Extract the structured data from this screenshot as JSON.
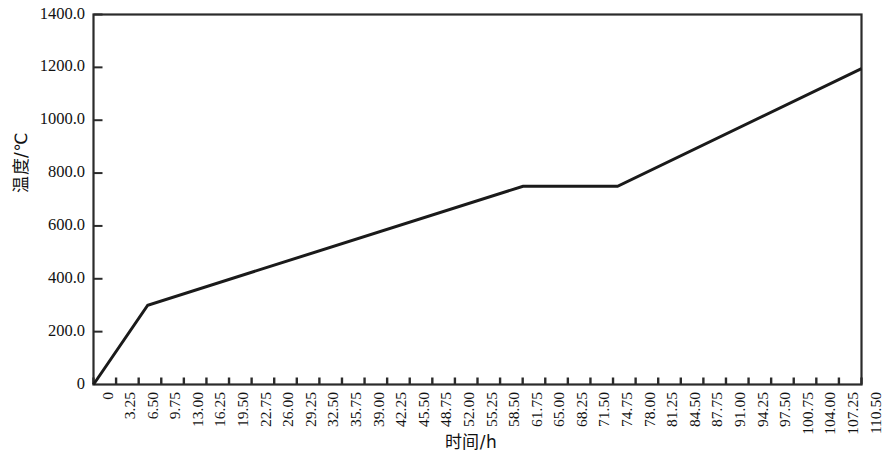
{
  "chart_data": {
    "type": "line",
    "title": "",
    "xlabel": "时间/h",
    "ylabel": "温度/℃",
    "xlim": [
      0,
      110.5
    ],
    "ylim": [
      0,
      1400
    ],
    "grid": false,
    "legend": null,
    "y_ticks": [
      0,
      200,
      400,
      600,
      800,
      1000,
      1200,
      1400
    ],
    "y_tick_labels": [
      "0",
      "200.0",
      "400.0",
      "600.0",
      "800.0",
      "1000.0",
      "1200.0",
      "1400.0"
    ],
    "x_ticks": [
      0,
      3.25,
      6.5,
      9.75,
      13.0,
      16.25,
      19.5,
      22.75,
      26.0,
      29.25,
      32.5,
      35.75,
      39.0,
      42.25,
      45.5,
      48.75,
      52.0,
      55.25,
      58.5,
      61.75,
      65.0,
      68.25,
      71.5,
      74.75,
      78.0,
      81.25,
      84.5,
      87.75,
      91.0,
      94.25,
      97.5,
      100.75,
      104.0,
      107.25,
      110.5
    ],
    "x_tick_labels": [
      "0",
      "3.25",
      "6.50",
      "9.75",
      "13.00",
      "16.25",
      "19.50",
      "22.75",
      "26.00",
      "29.25",
      "32.50",
      "35.75",
      "39.00",
      "42.25",
      "45.50",
      "48.75",
      "52.00",
      "55.25",
      "58.50",
      "61.75",
      "65.00",
      "68.25",
      "71.50",
      "74.75",
      "78.00",
      "81.25",
      "84.50",
      "87.75",
      "91.00",
      "94.25",
      "97.50",
      "100.75",
      "104.00",
      "107.25",
      "110.50"
    ],
    "series": [
      {
        "name": "温度曲线",
        "color": "#1a1a1a",
        "x": [
          0,
          7.8,
          61.8,
          75.4,
          110.5
        ],
        "y": [
          0,
          300,
          750,
          750,
          1195
        ]
      }
    ]
  },
  "axes": {
    "y_title": "温度/℃",
    "x_title": "时间/h"
  }
}
